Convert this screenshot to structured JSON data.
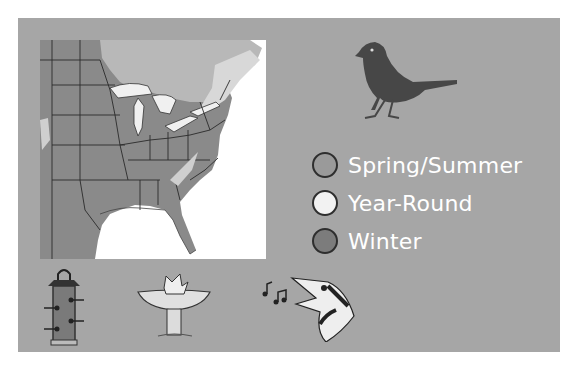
{
  "legend": {
    "items": [
      {
        "label": "Spring/Summer",
        "color": "#9a9a9a"
      },
      {
        "label": "Year-Round",
        "color": "#f2f2f2"
      },
      {
        "label": "Winter",
        "color": "#7c7c7c"
      }
    ]
  },
  "colors": {
    "panel": "#a6a6a6",
    "range": "#8a8a8a",
    "light_range": "#cfcfcf",
    "bird": "#474747",
    "water": "#ffffff"
  },
  "icons": {
    "bird": "bird-silhouette-icon",
    "feeder": "tube-feeder-icon",
    "birdbath": "birdbath-icon",
    "song": "singing-bird-icon"
  }
}
